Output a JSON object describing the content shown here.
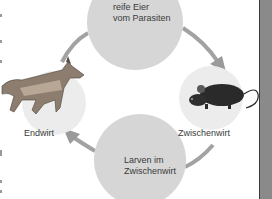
{
  "diagram": {
    "nodes": [
      {
        "id": "eggs",
        "label_line1": "reife Eier",
        "label_line2": "vom Parasiten"
      },
      {
        "id": "intermediate_host",
        "label": "Zwischenwirt",
        "icon": "mouse-icon"
      },
      {
        "id": "larvae",
        "label_line1": "Larven im",
        "label_line2": "Zwischenwirt"
      },
      {
        "id": "definitive_host",
        "label": "Endwirt",
        "icon": "wolf-icon"
      }
    ],
    "edges": [
      {
        "from": "eggs",
        "to": "intermediate_host"
      },
      {
        "from": "intermediate_host",
        "to": "larvae"
      },
      {
        "from": "larvae",
        "to": "definitive_host"
      },
      {
        "from": "definitive_host",
        "to": "eggs"
      }
    ],
    "colors": {
      "circle_fill": "#d6d6d6",
      "animal_circle_fill": "#ececec",
      "arrow": "#9a9a9a",
      "text": "#3a3a3a",
      "right_bar": "#8a8a8a"
    }
  }
}
